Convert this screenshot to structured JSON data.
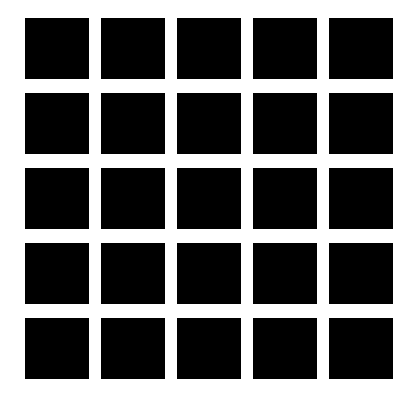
{
  "figure": {
    "type": "hermann-grid",
    "rows": 5,
    "columns": 5,
    "square_color": "#000000",
    "background_color": "#ffffff"
  }
}
